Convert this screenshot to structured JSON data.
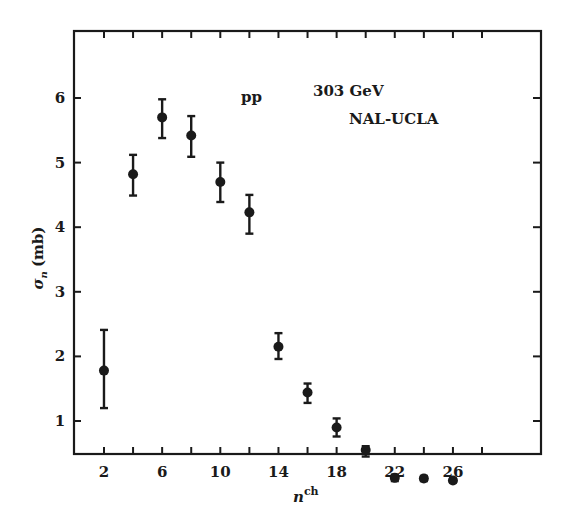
{
  "chart_data": {
    "type": "scatter",
    "title": "",
    "xlabel": "n^ch",
    "xlabel_base": "n",
    "xlabel_sup": "ch",
    "ylabel": "σ_n (mb)",
    "ylabel_base": "σ",
    "ylabel_sub": "n",
    "ylabel_unit": "(mb)",
    "xlim": [
      0,
      32
    ],
    "ylim": [
      0,
      7
    ],
    "grid": false,
    "legend": null,
    "x_tick_labels": [
      "2",
      "6",
      "10",
      "14",
      "18",
      "22",
      "26"
    ],
    "x_ticks": [
      2,
      6,
      10,
      14,
      18,
      22,
      26
    ],
    "x_minor_ticks": [
      2,
      4,
      6,
      8,
      10,
      12,
      14,
      16,
      18,
      20,
      22,
      24,
      26,
      28
    ],
    "y_tick_labels": [
      "1",
      "2",
      "3",
      "4",
      "5",
      "6"
    ],
    "y_ticks": [
      1,
      2,
      3,
      4,
      5,
      6
    ],
    "annotations": [
      {
        "text": "pp",
        "x": 13.2,
        "y": 5.95
      },
      {
        "text": "303 GeV",
        "x": 20.0,
        "y": 6.05
      },
      {
        "text": "NAL-UCLA",
        "x": 22.6,
        "y": 5.62
      }
    ],
    "series": [
      {
        "name": "pp 303 GeV NAL-UCLA",
        "x": [
          2,
          4,
          6,
          8,
          10,
          12,
          14,
          16,
          18,
          20,
          22,
          24,
          26
        ],
        "y": [
          1.78,
          4.82,
          5.7,
          5.42,
          4.7,
          4.23,
          2.15,
          1.44,
          0.9,
          0.55,
          0.12,
          0.11,
          0.08
        ],
        "err_lo": [
          0.58,
          0.33,
          0.32,
          0.33,
          0.31,
          0.33,
          0.19,
          0.16,
          0.14,
          0.1,
          0.05,
          0.04,
          0.03
        ],
        "err_hi": [
          0.63,
          0.3,
          0.28,
          0.3,
          0.3,
          0.27,
          0.21,
          0.14,
          0.14,
          0.06,
          0.05,
          0.04,
          0.03
        ]
      }
    ]
  },
  "labels": {
    "annotation_pp": "pp",
    "annotation_energy": "303 GeV",
    "annotation_experiment": "NAL-UCLA",
    "xlabel_base": "n",
    "xlabel_sup": "ch",
    "ylabel_base": "σ",
    "ylabel_sub": "n",
    "ylabel_unit": "(mb)"
  },
  "colors": {
    "ink": "#1a1a1a",
    "background": "#ffffff"
  }
}
